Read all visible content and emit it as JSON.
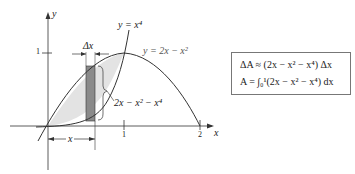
{
  "figure": {
    "axes": {
      "x_label": "x",
      "y_label": "y",
      "x_ticks": [
        "1",
        "2"
      ],
      "y_ticks": [
        "1"
      ]
    },
    "curves": {
      "quartic": "y = x⁴",
      "parabola": "y = 2x − x²"
    },
    "strip": {
      "width_label": "Δx",
      "height_label": "2x − x² − x⁴",
      "position_label": "x"
    },
    "colors": {
      "region_fill": "#e3e3e3",
      "strip_fill": "#8a8a8a",
      "line": "#333333"
    }
  },
  "formula_box": {
    "line1": "ΔA ≈ (2x − x² − x⁴) Δx",
    "line2": "A = ∫₀¹(2x − x² − x⁴) dx"
  }
}
